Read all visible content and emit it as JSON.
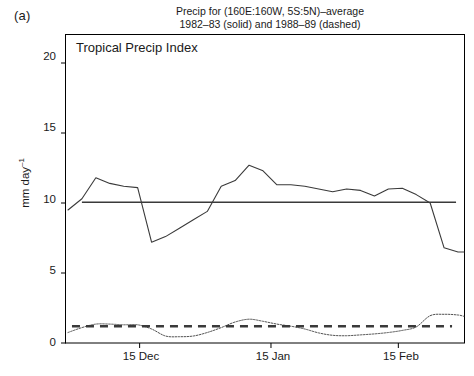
{
  "figure": {
    "panel_label": "(a)",
    "title_line1": "Precip for (160E:160W, 5S:5N)–average",
    "title_line2": "1982–83 (solid) and 1988–89 (dashed)",
    "plot_annotation": "Tropical Precip Index",
    "ylabel_text": "mm day",
    "ylabel_exponent": "–1",
    "line_color": "#3a3a3a",
    "axis_color": "#000000",
    "background": "#ffffff"
  },
  "chart_data": {
    "type": "line",
    "title": "Precip for (160E:160W, 5S:5N)–average 1982–83 (solid) and 1988–89 (dashed)",
    "annotation": "Tropical Precip Index",
    "xlabel": "",
    "ylabel": "mm day–1",
    "ylim": [
      0,
      22
    ],
    "xlim": [
      0,
      100
    ],
    "grid": false,
    "legend_position": "none",
    "yticks": [
      0,
      5,
      10,
      15,
      20
    ],
    "ytick_labels": [
      "0",
      "5",
      "10",
      "15",
      "20"
    ],
    "xticks": [
      18.5,
      51.5,
      83.5
    ],
    "xtick_labels": [
      "15 Dec",
      "15 Jan",
      "15 Feb"
    ],
    "series": [
      {
        "name": "1982–83 precip (solid)",
        "style": "solid",
        "x": [
          0.5,
          4.0,
          7.5,
          11.0,
          14.5,
          18.0,
          21.5,
          25.0,
          28.5,
          32.0,
          35.5,
          39.0,
          42.5,
          46.0,
          49.5,
          53.0,
          56.5,
          60.0,
          63.5,
          67.0,
          70.5,
          74.0,
          77.5,
          81.0,
          84.5,
          88.0,
          91.5,
          95.0,
          98.5,
          100.0
        ],
        "values": [
          9.5,
          10.3,
          11.8,
          11.4,
          11.2,
          11.1,
          7.2,
          7.6,
          8.2,
          8.8,
          9.4,
          11.2,
          11.6,
          12.7,
          12.3,
          11.3,
          11.3,
          11.2,
          11.0,
          10.8,
          11.0,
          10.9,
          10.5,
          11.0,
          11.05,
          10.6,
          10.0,
          6.8,
          6.5,
          6.5
        ]
      },
      {
        "name": "1982–83 mean reference (solid horizontal)",
        "style": "solid-horizontal",
        "value": 10.05,
        "x_start": 4.0,
        "x_end": 98.0
      },
      {
        "name": "1988–89 precip (dotted)",
        "style": "dotted",
        "x": [
          0.5,
          4.0,
          7.5,
          11.0,
          14.5,
          18.0,
          21.5,
          25.0,
          28.5,
          32.0,
          35.5,
          39.0,
          42.5,
          46.0,
          49.5,
          53.0,
          56.5,
          60.0,
          63.5,
          67.0,
          70.5,
          74.0,
          77.5,
          81.0,
          84.5,
          88.0,
          91.5,
          95.0,
          98.5,
          100.0
        ],
        "values": [
          0.75,
          1.1,
          1.35,
          1.35,
          1.3,
          1.3,
          1.0,
          0.5,
          0.45,
          0.5,
          0.75,
          1.1,
          1.5,
          1.7,
          1.55,
          1.35,
          1.2,
          1.0,
          0.72,
          0.55,
          0.52,
          0.58,
          0.65,
          0.75,
          0.9,
          1.15,
          1.95,
          2.05,
          2.0,
          1.9
        ]
      },
      {
        "name": "1988–89 mean reference (dashed horizontal)",
        "style": "dashed-horizontal",
        "value": 1.2,
        "x_start": 1.5,
        "x_end": 97.0
      }
    ]
  }
}
